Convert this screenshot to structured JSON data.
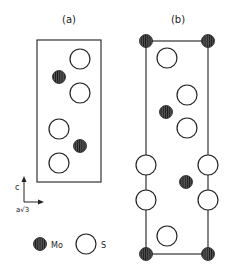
{
  "panels": [
    {
      "label": "(a)",
      "atoms": [
        {
          "element": "S",
          "pos": "upper-right"
        },
        {
          "element": "Mo",
          "pos": "upper-left"
        },
        {
          "element": "S",
          "pos": "upper-right"
        },
        {
          "element": "S",
          "pos": "lower-left"
        },
        {
          "element": "Mo",
          "pos": "lower-right"
        },
        {
          "element": "S",
          "pos": "lower-left"
        }
      ]
    },
    {
      "label": "(b)",
      "atoms": [
        {
          "element": "Mo",
          "pos": "corner-top-left"
        },
        {
          "element": "Mo",
          "pos": "corner-top-right"
        },
        {
          "element": "S",
          "pos": "interior"
        },
        {
          "element": "S",
          "pos": "interior"
        },
        {
          "element": "Mo",
          "pos": "interior"
        },
        {
          "element": "S",
          "pos": "interior"
        },
        {
          "element": "S",
          "pos": "edge-left"
        },
        {
          "element": "S",
          "pos": "edge-right"
        },
        {
          "element": "Mo",
          "pos": "interior"
        },
        {
          "element": "S",
          "pos": "edge-left"
        },
        {
          "element": "S",
          "pos": "edge-right"
        },
        {
          "element": "S",
          "pos": "interior"
        },
        {
          "element": "Mo",
          "pos": "corner-bottom-left"
        },
        {
          "element": "Mo",
          "pos": "corner-bottom-right"
        }
      ]
    }
  ],
  "axes": {
    "vertical_label": "c",
    "horizontal_label": "a√3"
  },
  "legend": {
    "mo_label": "Mo",
    "s_label": "S"
  }
}
